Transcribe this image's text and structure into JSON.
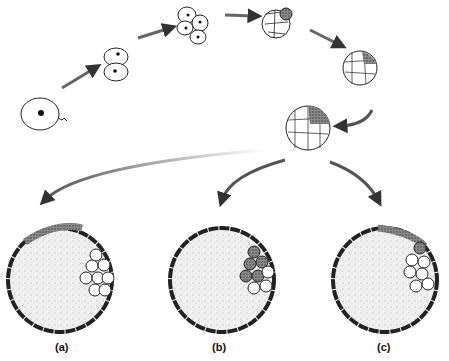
{
  "diagram": {
    "type": "embryo-development-sequence",
    "stages": [
      "zygote",
      "2-cell",
      "4-cell",
      "8-cell",
      "morula",
      "early-blastocyst"
    ],
    "outcomes": [
      {
        "id": "a",
        "label": "(a)"
      },
      {
        "id": "b",
        "label": "(b)"
      },
      {
        "id": "c",
        "label": "(c)"
      }
    ],
    "colors": {
      "outline": "#222222",
      "arrow": "#555555",
      "stipple": "#e6e6e6",
      "dark_cells": "#777777"
    }
  }
}
